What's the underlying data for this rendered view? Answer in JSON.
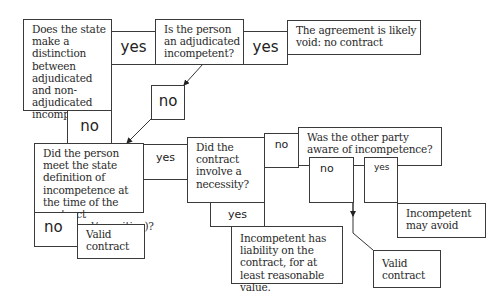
{
  "diagram": {
    "type": "flowchart",
    "nodes": {
      "q1": "Does the state make a distinction between adjudicated and non-adjudicated incompetents?",
      "q2": "Is the person an adjudicated incompetent?",
      "r_void": "The agreement is likely void: no contract",
      "q3": "Did the person meet the state definition of incompetence at the time of the contract (volitional/cognitive)?",
      "r_valid_1": "Valid contract",
      "q4": "Did the contract involve a necessity?",
      "r_liability": "Incompetent has liability on the contract, for at least reasonable value.",
      "q5": "Was the other party aware of incompetence?",
      "r_avoid": "Incompetent may avoid",
      "r_valid_2": "Valid contract"
    },
    "labels": {
      "q1_yes": "yes",
      "q2_yes": "yes",
      "q2_no": "no",
      "q1_no": "no",
      "q3_yes": "yes",
      "q3_no": "no",
      "q4_no": "no",
      "q4_yes": "yes",
      "q5_no": "no",
      "q5_yes": "yes"
    }
  }
}
